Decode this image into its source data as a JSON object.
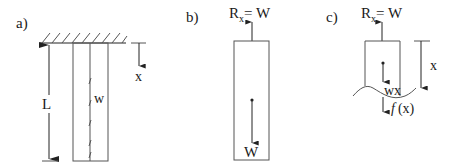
{
  "panels": {
    "a": {
      "label": "a)",
      "length_label": "L",
      "load_label": "w",
      "axis_label": "x"
    },
    "b": {
      "label": "b)",
      "reaction_R": "R",
      "reaction_sub": "x",
      "reaction_eq": "= W",
      "weight_label": "W"
    },
    "c": {
      "label": "c)",
      "reaction_R": "R",
      "reaction_sub": "x",
      "reaction_eq": "= W",
      "axis_label": "x",
      "partial_weight_label": "wx",
      "internal_force_f": "f",
      "internal_force_arg": "(x)"
    }
  },
  "colors": {
    "line": "#555555",
    "text": "#1a1a1a",
    "background": "#ffffff"
  }
}
